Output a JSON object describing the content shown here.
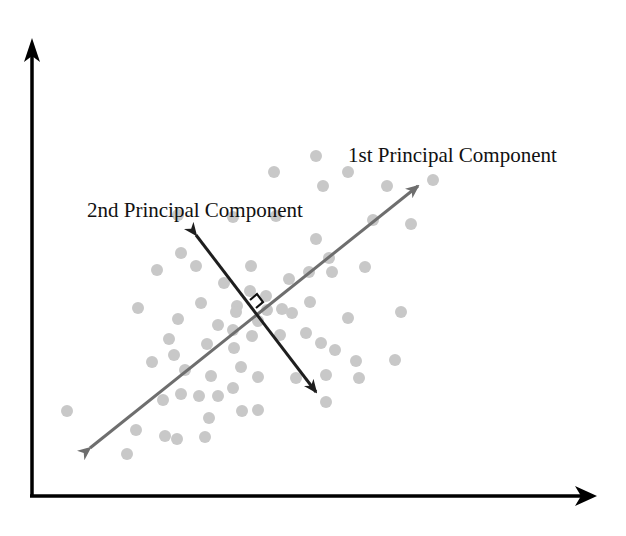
{
  "diagram": {
    "title": "",
    "labels": {
      "first_pc": "1st Principal Component",
      "second_pc": "2nd Principal Component"
    },
    "colors": {
      "axes": "#000000",
      "first_pc_arrow": "#6e6e6e",
      "second_pc_arrow": "#1e1e1e",
      "points": "#c8c8c8",
      "text": "#111111",
      "background": "#ffffff"
    }
  },
  "chart_data": {
    "type": "scatter",
    "title": "",
    "xlabel": "",
    "ylabel": "",
    "grid": false,
    "legend": false,
    "annotations": [
      {
        "text": "1st Principal Component",
        "kind": "arrow-label",
        "from_px": [
          86,
          451
        ],
        "to_px": [
          421,
          184
        ]
      },
      {
        "text": "2nd Principal Component",
        "kind": "arrow-label",
        "from_px": [
          318,
          395
        ],
        "to_px": [
          194,
          232
        ]
      },
      {
        "text": "right-angle marker",
        "kind": "perpendicular",
        "at_px": [
          256,
          308
        ]
      }
    ],
    "points_px": [
      [
        316,
        156
      ],
      [
        274,
        172
      ],
      [
        348,
        172
      ],
      [
        323,
        186
      ],
      [
        387,
        186
      ],
      [
        433,
        180
      ],
      [
        178,
        215
      ],
      [
        233,
        217
      ],
      [
        276,
        216
      ],
      [
        373,
        220
      ],
      [
        411,
        224
      ],
      [
        316,
        239
      ],
      [
        181,
        253
      ],
      [
        157,
        270
      ],
      [
        196,
        266
      ],
      [
        251,
        266
      ],
      [
        329,
        258
      ],
      [
        365,
        267
      ],
      [
        309,
        272
      ],
      [
        332,
        272
      ],
      [
        289,
        279
      ],
      [
        138,
        308
      ],
      [
        178,
        319
      ],
      [
        201,
        303
      ],
      [
        237,
        306
      ],
      [
        266,
        296
      ],
      [
        224,
        283
      ],
      [
        250,
        291
      ],
      [
        267,
        310
      ],
      [
        282,
        309
      ],
      [
        310,
        302
      ],
      [
        348,
        318
      ],
      [
        401,
        312
      ],
      [
        218,
        325
      ],
      [
        236,
        312
      ],
      [
        258,
        321
      ],
      [
        292,
        313
      ],
      [
        252,
        336
      ],
      [
        169,
        339
      ],
      [
        174,
        355
      ],
      [
        152,
        362
      ],
      [
        207,
        344
      ],
      [
        233,
        330
      ],
      [
        234,
        348
      ],
      [
        185,
        370
      ],
      [
        211,
        376
      ],
      [
        280,
        335
      ],
      [
        306,
        333
      ],
      [
        321,
        343
      ],
      [
        335,
        350
      ],
      [
        356,
        361
      ],
      [
        395,
        360
      ],
      [
        326,
        375
      ],
      [
        163,
        400
      ],
      [
        181,
        394
      ],
      [
        199,
        396
      ],
      [
        218,
        396
      ],
      [
        233,
        388
      ],
      [
        241,
        367
      ],
      [
        258,
        377
      ],
      [
        209,
        418
      ],
      [
        242,
        411
      ],
      [
        258,
        410
      ],
      [
        296,
        378
      ],
      [
        67,
        411
      ],
      [
        136,
        430
      ],
      [
        165,
        436
      ],
      [
        177,
        439
      ],
      [
        205,
        437
      ],
      [
        127,
        454
      ],
      [
        359,
        378
      ],
      [
        326,
        402
      ]
    ],
    "x_axis_px": {
      "from": [
        32,
        496
      ],
      "to": [
        596,
        496
      ]
    },
    "y_axis_px": {
      "from": [
        32,
        496
      ],
      "to": [
        32,
        40
      ]
    }
  }
}
